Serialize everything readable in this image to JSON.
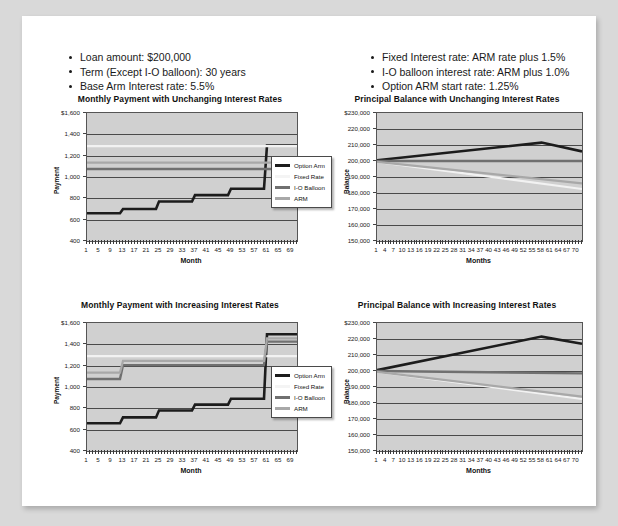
{
  "document": {
    "background_color": "#d9d9d9",
    "card_color": "#ffffff"
  },
  "assumptions_left": {
    "items": [
      "Loan amount: $200,000",
      "Term (Except I-O balloon): 30 years",
      "Base Arm Interest rate: 5.5%"
    ]
  },
  "assumptions_right": {
    "items": [
      "Fixed Interest rate: ARM rate plus 1.5%",
      "I-O balloon interest rate: ARM plus 1.0%",
      "Option ARM start rate: 1.25%"
    ]
  },
  "legend": {
    "items": [
      {
        "label": "Option Arm",
        "color": "#1c1c1c"
      },
      {
        "label": "Fixed Rate",
        "color": "#f2f2f2"
      },
      {
        "label": "I-O Balloon",
        "color": "#707070"
      },
      {
        "label": "ARM",
        "color": "#a8a8a8"
      }
    ]
  },
  "chart_data": [
    {
      "id": "payment-unchanging",
      "type": "line",
      "title": "Monthly Payment with Unchanging Interest Rates",
      "xlabel": "Month",
      "ylabel": "Payment",
      "ylim": [
        400,
        1600
      ],
      "yticks": [
        400,
        600,
        800,
        1000,
        1200,
        1400,
        1600
      ],
      "ytick_labels": [
        "400",
        "600",
        "800",
        "1,000",
        "1,200",
        "1,400",
        "$1,600"
      ],
      "xlim": [
        1,
        71
      ],
      "xticks": [
        1,
        5,
        9,
        13,
        17,
        21,
        25,
        29,
        33,
        37,
        41,
        45,
        49,
        53,
        57,
        61,
        65,
        69
      ],
      "xtick_labels": [
        "1",
        "5",
        "9",
        "13",
        "17",
        "21",
        "25",
        "29",
        "33",
        "37",
        "41",
        "45",
        "49",
        "53",
        "57",
        "61",
        "65",
        "69"
      ],
      "grid": true,
      "legend_position": "right",
      "series": [
        {
          "name": "Option Arm",
          "color": "#1c1c1c",
          "width": 2.6,
          "x": [
            1,
            12,
            13,
            24,
            25,
            36,
            37,
            48,
            49,
            60,
            61,
            71
          ],
          "y": [
            660,
            660,
            700,
            700,
            770,
            770,
            830,
            830,
            890,
            890,
            1295,
            1295
          ]
        },
        {
          "name": "Fixed Rate",
          "color": "#f2f2f2",
          "width": 2.2,
          "x": [
            1,
            71
          ],
          "y": [
            1290,
            1290
          ]
        },
        {
          "name": "I-O Balloon",
          "color": "#707070",
          "width": 2.4,
          "x": [
            1,
            71
          ],
          "y": [
            1075,
            1075
          ]
        },
        {
          "name": "ARM",
          "color": "#a8a8a8",
          "width": 2.2,
          "x": [
            1,
            71
          ],
          "y": [
            1135,
            1135
          ]
        }
      ]
    },
    {
      "id": "balance-unchanging",
      "type": "line",
      "title": "Principal Balance with Unchanging Interest Rates",
      "xlabel": "Months",
      "ylabel": "Balance",
      "ylim": [
        150000,
        230000
      ],
      "yticks": [
        150000,
        160000,
        170000,
        180000,
        190000,
        200000,
        210000,
        220000,
        230000
      ],
      "ytick_labels": [
        "150,000",
        "160,000",
        "170,000",
        "180,000",
        "190,000",
        "200,000",
        "210,000",
        "220,000",
        "$230,000"
      ],
      "xlim": [
        1,
        72
      ],
      "xticks": [
        1,
        4,
        7,
        10,
        13,
        16,
        19,
        22,
        25,
        28,
        31,
        34,
        37,
        40,
        43,
        46,
        49,
        52,
        55,
        58,
        61,
        64,
        67,
        70
      ],
      "xtick_labels": [
        "1",
        "4",
        "7",
        "10",
        "13",
        "16",
        "19",
        "22",
        "25",
        "28",
        "31",
        "34",
        "37",
        "40",
        "43",
        "46",
        "49",
        "52",
        "55",
        "58",
        "61",
        "64",
        "67",
        "70"
      ],
      "grid": true,
      "legend_position": "none",
      "series": [
        {
          "name": "Option Arm",
          "color": "#1c1c1c",
          "width": 2.6,
          "x": [
            1,
            58,
            72
          ],
          "y": [
            200500,
            211500,
            206000
          ]
        },
        {
          "name": "Fixed Rate",
          "color": "#f2f2f2",
          "width": 2.2,
          "x": [
            1,
            72
          ],
          "y": [
            199500,
            182500
          ]
        },
        {
          "name": "I-O Balloon",
          "color": "#707070",
          "width": 2.4,
          "x": [
            1,
            72
          ],
          "y": [
            200000,
            200000
          ]
        },
        {
          "name": "ARM",
          "color": "#a8a8a8",
          "width": 2.2,
          "x": [
            1,
            72
          ],
          "y": [
            199500,
            186000
          ]
        }
      ]
    },
    {
      "id": "payment-increasing",
      "type": "line",
      "title": "Monthly Payment with Increasing Interest Rates",
      "xlabel": "Month",
      "ylabel": "Payment",
      "ylim": [
        400,
        1600
      ],
      "yticks": [
        400,
        600,
        800,
        1000,
        1200,
        1400,
        1600
      ],
      "ytick_labels": [
        "400",
        "600",
        "800",
        "1,000",
        "1,200",
        "1,400",
        "$1,600"
      ],
      "xlim": [
        1,
        71
      ],
      "xticks": [
        1,
        5,
        9,
        13,
        17,
        21,
        25,
        29,
        33,
        37,
        41,
        45,
        49,
        53,
        57,
        61,
        65,
        69
      ],
      "xtick_labels": [
        "1",
        "5",
        "9",
        "13",
        "17",
        "21",
        "25",
        "29",
        "33",
        "37",
        "41",
        "45",
        "49",
        "53",
        "57",
        "61",
        "65",
        "69"
      ],
      "grid": true,
      "legend_position": "right",
      "series": [
        {
          "name": "Option Arm",
          "color": "#1c1c1c",
          "width": 2.6,
          "x": [
            1,
            12,
            13,
            24,
            25,
            36,
            37,
            48,
            49,
            60,
            61,
            71
          ],
          "y": [
            660,
            660,
            715,
            715,
            780,
            780,
            835,
            835,
            890,
            890,
            1495,
            1495
          ]
        },
        {
          "name": "Fixed Rate",
          "color": "#f2f2f2",
          "width": 2.2,
          "x": [
            1,
            71
          ],
          "y": [
            1290,
            1290
          ]
        },
        {
          "name": "I-O Balloon",
          "color": "#707070",
          "width": 2.4,
          "x": [
            1,
            12,
            13,
            60,
            61,
            71
          ],
          "y": [
            1075,
            1075,
            1205,
            1205,
            1425,
            1425
          ]
        },
        {
          "name": "ARM",
          "color": "#a8a8a8",
          "width": 2.2,
          "x": [
            1,
            12,
            13,
            60,
            61,
            71
          ],
          "y": [
            1135,
            1135,
            1245,
            1245,
            1455,
            1455
          ]
        }
      ]
    },
    {
      "id": "balance-increasing",
      "type": "line",
      "title": "Principal Balance with Increasing Interest Rates",
      "xlabel": "Months",
      "ylabel": "Balance",
      "ylim": [
        150000,
        230000
      ],
      "yticks": [
        150000,
        160000,
        170000,
        180000,
        190000,
        200000,
        210000,
        220000,
        230000
      ],
      "ytick_labels": [
        "150,000",
        "160,000",
        "170,000",
        "180,000",
        "190,000",
        "200,000",
        "210,000",
        "220,000",
        "$230,000"
      ],
      "xlim": [
        1,
        72
      ],
      "xticks": [
        1,
        4,
        7,
        10,
        13,
        16,
        19,
        22,
        25,
        28,
        31,
        34,
        37,
        40,
        43,
        46,
        49,
        52,
        55,
        58,
        61,
        64,
        67,
        70
      ],
      "xtick_labels": [
        "1",
        "4",
        "7",
        "10",
        "13",
        "16",
        "19",
        "22",
        "25",
        "28",
        "31",
        "34",
        "37",
        "40",
        "43",
        "46",
        "49",
        "52",
        "55",
        "58",
        "61",
        "64",
        "67",
        "70"
      ],
      "grid": true,
      "legend_position": "none",
      "series": [
        {
          "name": "Option Arm",
          "color": "#1c1c1c",
          "width": 2.6,
          "x": [
            1,
            58,
            72
          ],
          "y": [
            200500,
            221500,
            217000
          ]
        },
        {
          "name": "Fixed Rate",
          "color": "#f2f2f2",
          "width": 2.2,
          "x": [
            1,
            72
          ],
          "y": [
            199500,
            182500
          ]
        },
        {
          "name": "I-O Balloon",
          "color": "#707070",
          "width": 2.4,
          "x": [
            1,
            72
          ],
          "y": [
            200000,
            198500
          ]
        },
        {
          "name": "ARM",
          "color": "#a8a8a8",
          "width": 2.2,
          "x": [
            1,
            72
          ],
          "y": [
            199500,
            184000
          ]
        }
      ]
    }
  ]
}
